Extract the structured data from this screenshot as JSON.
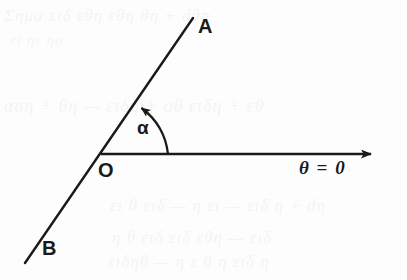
{
  "figure": {
    "kind": "geometry-diagram",
    "background_color": "#fdfdfd",
    "ink_color": "#1a1a1a",
    "ghost_color": "#f4f4f4",
    "width": 407,
    "height": 280
  },
  "labels": {
    "ray_a": "A",
    "ray_b": "B",
    "origin": "O",
    "angle": "α",
    "reference_axis": "θ = 0"
  },
  "geometry": {
    "origin": {
      "x": 101,
      "y": 154
    },
    "line_ab": {
      "name": "line-AB",
      "from": {
        "x": 193,
        "y": 18
      },
      "to": {
        "x": 25,
        "y": 263
      },
      "stroke_width": 2.4
    },
    "reference_ray": {
      "name": "reference-ray-theta-zero",
      "from": {
        "x": 101,
        "y": 154
      },
      "to": {
        "x": 383,
        "y": 154
      },
      "stroke_width": 2.4,
      "arrowhead": "right"
    },
    "angle_arc": {
      "name": "angle-arc-alpha",
      "radius": 67,
      "start": {
        "x": 168,
        "y": 154
      },
      "end": {
        "x": 140,
        "y": 104
      },
      "sweep_direction": "counterclockwise",
      "arrowhead": "end",
      "stroke_width": 2.2
    }
  },
  "ghost_text": {
    "note": "faint bleed-through from reverse side of the printed page",
    "lines": [
      {
        "text": "Σημα ειδ εθη          εθη           θη + dθη",
        "x": 4,
        "y": 6,
        "size": 17
      },
      {
        "text": "ει              ητ              ηο",
        "x": 10,
        "y": 32,
        "size": 15
      },
      {
        "text": "αση + θη — ειδη + οθ ειδη + εθ",
        "x": 4,
        "y": 96,
        "size": 18
      },
      {
        "text": "ει θ ειδ — η ει — ειδ η + dη",
        "x": 110,
        "y": 196,
        "size": 17
      },
      {
        "text": "η θ ειδ ειδ εθη — ειδ",
        "x": 112,
        "y": 228,
        "size": 17
      },
      {
        "text": "ειδηθ — η ε θ η ειδ η",
        "x": 108,
        "y": 252,
        "size": 17
      }
    ]
  }
}
